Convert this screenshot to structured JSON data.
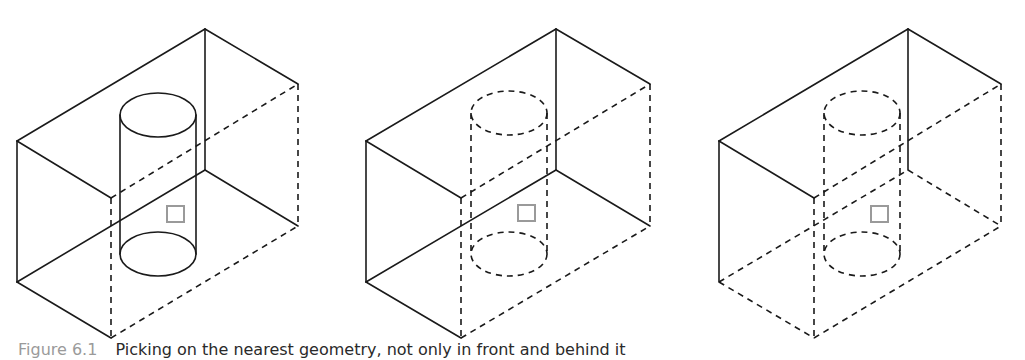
{
  "caption": {
    "label": "Figure 6.1",
    "text": "Picking on the nearest geometry, not only in front and behind it"
  },
  "colors": {
    "line": "#1a1a1a",
    "pick_box": "#9a9a9a",
    "background": "#ffffff"
  },
  "panels": [
    {
      "name": "panel-visible-cylinder",
      "description": "Box with cylinder fully visible (solid)",
      "cylinder_style": "solid",
      "box_hidden_edges": [
        "front-vertical",
        "front-bottom-right",
        "right-vertical",
        "back-diagonal"
      ]
    },
    {
      "name": "panel-hidden-cylinder",
      "description": "Box with cylinder hidden (dashed)",
      "cylinder_style": "dashed",
      "box_hidden_edges": [
        "front-vertical",
        "front-bottom-right",
        "right-vertical",
        "back-diagonal"
      ]
    },
    {
      "name": "panel-hidden-cylinder-open-bottom",
      "description": "Box with bottom edges hidden and cylinder dashed",
      "cylinder_style": "dashed",
      "box_hidden_edges": [
        "front-vertical",
        "front-bottom-right",
        "right-vertical",
        "back-diagonal",
        "left-bottom",
        "bottom-back",
        "bottom-right"
      ]
    }
  ]
}
